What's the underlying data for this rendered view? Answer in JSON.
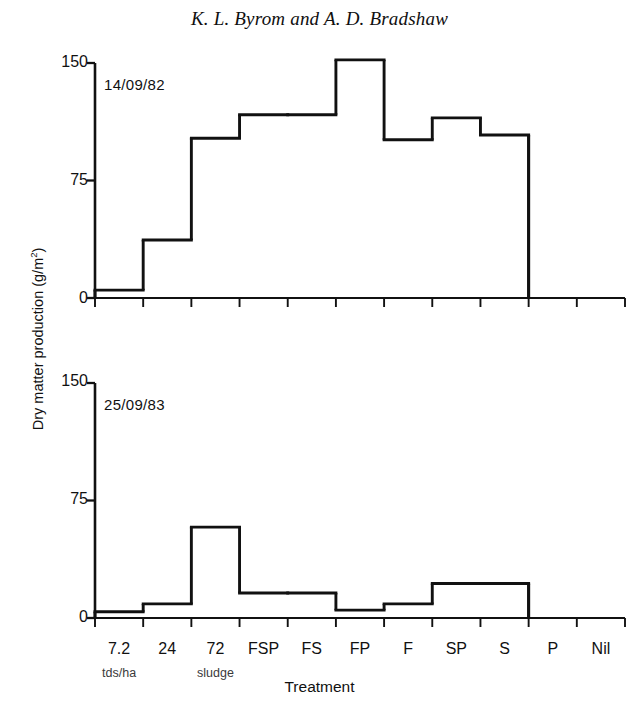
{
  "figure": {
    "title": "K. L. Byrom and A. D. Bradshaw",
    "xlabel": "Treatment",
    "ylabel_text": "Dry matter production (g/m",
    "ylabel_sup": "2",
    "ylabel_tail": ")",
    "sublabel_left": "tds/ha",
    "sublabel_right": "sludge",
    "ink_color": "#111111",
    "background_color": "#ffffff"
  },
  "chart_data": [
    {
      "type": "bar",
      "title": "14/09/82",
      "panel": "top",
      "xlabel": "Treatment",
      "ylabel": "Dry matter production (g/m2)",
      "categories": [
        "7.2",
        "24",
        "72",
        "FSP",
        "FS",
        "FP",
        "F",
        "SP",
        "S",
        "P",
        "Nil"
      ],
      "values": [
        5,
        37,
        102,
        117,
        117,
        152,
        101,
        115,
        104,
        0,
        0
      ],
      "yticks": [
        0,
        75,
        150
      ],
      "ylim": [
        0,
        160
      ],
      "grid": false,
      "legend": "none",
      "style": "outlined step histogram, contiguous bars, no fill"
    },
    {
      "type": "bar",
      "title": "25/09/83",
      "panel": "bottom",
      "xlabel": "Treatment",
      "ylabel": "Dry matter production (g/m2)",
      "categories": [
        "7.2",
        "24",
        "72",
        "FSP",
        "FS",
        "FP",
        "F",
        "SP",
        "S",
        "P",
        "Nil"
      ],
      "values": [
        4,
        9,
        58,
        16,
        16,
        5,
        9,
        22,
        22,
        0,
        0
      ],
      "yticks": [
        0,
        75,
        150
      ],
      "ylim": [
        0,
        160
      ],
      "grid": false,
      "legend": "none",
      "style": "outlined step histogram, contiguous bars, no fill"
    }
  ],
  "axis_ticks": {
    "y_labels": [
      "150",
      "75",
      "0"
    ]
  }
}
